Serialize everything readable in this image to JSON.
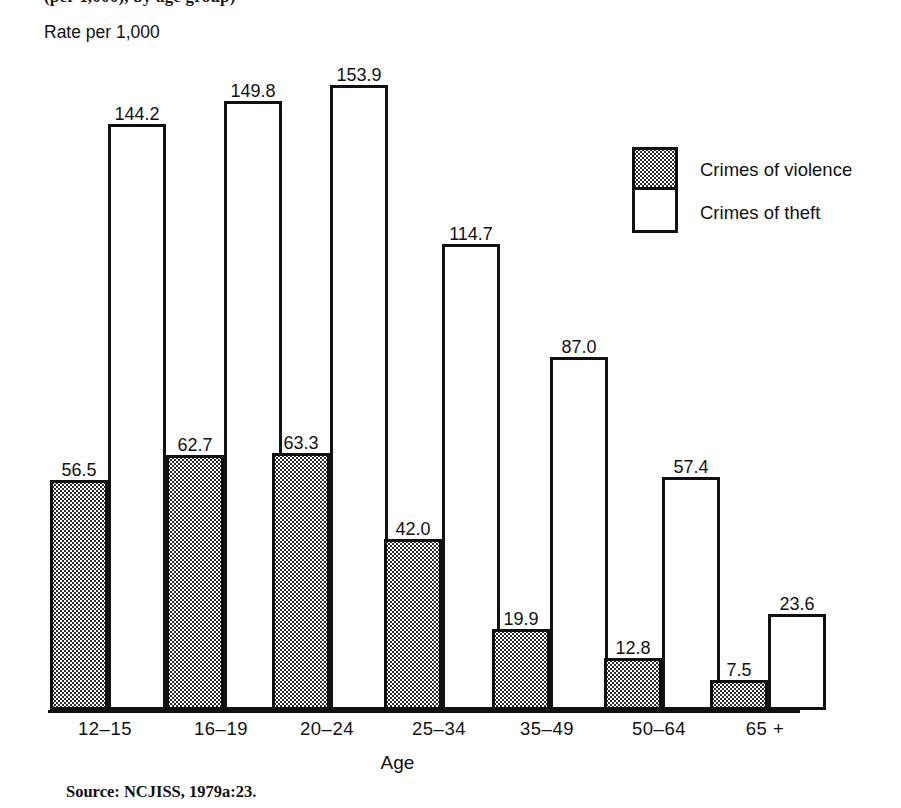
{
  "figure": {
    "title_cropped": "(per 1,000), by age group)",
    "y_caption": "Rate per 1,000",
    "x_axis_title": "Age",
    "source_note": "Source: NCJISS, 1979a:23."
  },
  "legend": {
    "items": [
      {
        "key": "violence",
        "label": "Crimes of violence",
        "fill": "stipple"
      },
      {
        "key": "theft",
        "label": "Crimes of theft",
        "fill": "white"
      }
    ]
  },
  "colors": {
    "ink": "#111111",
    "paper": "#ffffff",
    "stipple": "#2b2b2b"
  },
  "chart_data": {
    "type": "bar",
    "title": "(per 1,000), by age group)",
    "xlabel": "Age",
    "ylabel": "Rate per 1,000",
    "ylim": [
      0,
      160
    ],
    "grid": false,
    "legend_position": "upper-right",
    "categories": [
      "12–15",
      "16–19",
      "20–24",
      "25–34",
      "35–49",
      "50–64",
      "65 +"
    ],
    "series": [
      {
        "name": "Crimes of violence",
        "values": [
          56.5,
          62.7,
          63.3,
          42.0,
          19.9,
          12.8,
          7.5
        ]
      },
      {
        "name": "Crimes of theft",
        "values": [
          144.2,
          149.8,
          153.9,
          114.7,
          87.0,
          57.4,
          23.6
        ]
      }
    ],
    "data_labels": {
      "violence": [
        "56.5",
        "62.7",
        "63.3",
        "42.0",
        "19.9",
        "12.8",
        "7.5"
      ],
      "theft": [
        "144.2",
        "149.8",
        "153.9",
        "114.7",
        "87.0",
        "57.4",
        "23.6"
      ]
    }
  },
  "layout": {
    "baseline_y": 710,
    "plot_height_px": 650,
    "value_per_px": 0.2338,
    "groups": [
      {
        "x": 50,
        "bar_w": 58,
        "gap": 0,
        "label_x": 40,
        "label_w": 130
      },
      {
        "x": 166,
        "bar_w": 58,
        "gap": 0,
        "label_x": 156,
        "label_w": 130
      },
      {
        "x": 272,
        "bar_w": 58,
        "gap": 0,
        "label_x": 262,
        "label_w": 130
      },
      {
        "x": 384,
        "bar_w": 58,
        "gap": 0,
        "label_x": 374,
        "label_w": 130
      },
      {
        "x": 492,
        "bar_w": 58,
        "gap": 0,
        "label_x": 482,
        "label_w": 130
      },
      {
        "x": 604,
        "bar_w": 58,
        "gap": 0,
        "label_x": 594,
        "label_w": 130
      },
      {
        "x": 710,
        "bar_w": 58,
        "gap": 0,
        "label_x": 700,
        "label_w": 130
      }
    ]
  }
}
